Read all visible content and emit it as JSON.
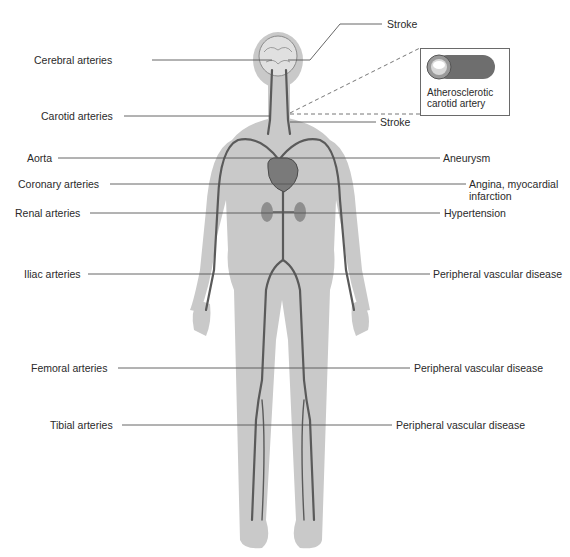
{
  "diagram": {
    "colors": {
      "background": "#ffffff",
      "body_silhouette": "#c9c9c9",
      "artery": "#5a5a5a",
      "leader_line": "#555555",
      "text": "#2a2a2a"
    },
    "left_labels": [
      {
        "id": "cerebral",
        "text": "Cerebral arteries"
      },
      {
        "id": "carotid",
        "text": "Carotid arteries"
      },
      {
        "id": "aorta",
        "text": "Aorta"
      },
      {
        "id": "coronary",
        "text": "Coronary arteries"
      },
      {
        "id": "renal",
        "text": "Renal arteries"
      },
      {
        "id": "iliac",
        "text": "Iliac arteries"
      },
      {
        "id": "femoral",
        "text": "Femoral arteries"
      },
      {
        "id": "tibial",
        "text": "Tibial arteries"
      }
    ],
    "right_labels": [
      {
        "id": "stroke_top",
        "text": "Stroke"
      },
      {
        "id": "stroke_carotid",
        "text": "Stroke"
      },
      {
        "id": "aneurysm",
        "text": "Aneurysm"
      },
      {
        "id": "angina",
        "text": "Angina, myocardial infarction"
      },
      {
        "id": "hypertension",
        "text": "Hypertension"
      },
      {
        "id": "pvd_iliac",
        "text": "Peripheral vascular disease"
      },
      {
        "id": "pvd_femoral",
        "text": "Peripheral vascular disease"
      },
      {
        "id": "pvd_tibial",
        "text": "Peripheral vascular disease"
      }
    ],
    "inset": {
      "caption": "Atherosclerotic carotid artery",
      "icon": "artery-cross-section-icon"
    }
  }
}
